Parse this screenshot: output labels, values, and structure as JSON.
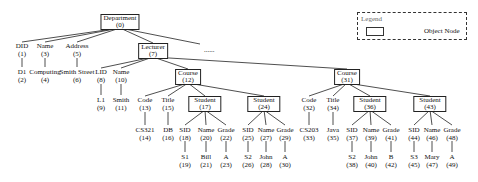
{
  "legend": {
    "title": "Legend",
    "items": [
      {
        "shape": "rectangle",
        "label": "Object Node"
      }
    ]
  },
  "ellipsis": "......",
  "nodes": {
    "n0": {
      "name": "Department",
      "id": "(0)",
      "type": "object"
    },
    "n1": {
      "name": "DID",
      "id": "(1)"
    },
    "n2": {
      "name": "D1",
      "id": "(2)"
    },
    "n3": {
      "name": "Name",
      "id": "(3)"
    },
    "n4": {
      "name": "Computing",
      "id": "(4)"
    },
    "n5": {
      "name": "Address",
      "id": "(5)"
    },
    "n6": {
      "name": "Smith Street",
      "id": "(6)"
    },
    "n7": {
      "name": "Lecturer",
      "id": "(7)",
      "type": "object"
    },
    "n8": {
      "name": "LID",
      "id": "(8)"
    },
    "n9": {
      "name": "L1",
      "id": "(9)"
    },
    "n10": {
      "name": "Name",
      "id": "(10)"
    },
    "n11": {
      "name": "Smith",
      "id": "(11)"
    },
    "n12": {
      "name": "Course",
      "id": "(12)",
      "type": "object"
    },
    "n13": {
      "name": "Code",
      "id": "(13)"
    },
    "n14": {
      "name": "CS321",
      "id": "(14)"
    },
    "n15": {
      "name": "Title",
      "id": "(15)"
    },
    "n16": {
      "name": "DB",
      "id": "(16)"
    },
    "n17": {
      "name": "Student",
      "id": "(17)",
      "type": "object"
    },
    "n18": {
      "name": "SID",
      "id": "(18)"
    },
    "n19": {
      "name": "S1",
      "id": "(19)"
    },
    "n20": {
      "name": "Name",
      "id": "(20)"
    },
    "n21": {
      "name": "Bill",
      "id": "(21)"
    },
    "n22": {
      "name": "Grade",
      "id": "(22)"
    },
    "n23": {
      "name": "A",
      "id": "(23)"
    },
    "n24": {
      "name": "Student",
      "id": "(24)",
      "type": "object"
    },
    "n25": {
      "name": "SID",
      "id": "(25)"
    },
    "n26": {
      "name": "S2",
      "id": "(26)"
    },
    "n27": {
      "name": "Name",
      "id": "(27)"
    },
    "n28": {
      "name": "John",
      "id": "(28)"
    },
    "n29": {
      "name": "Grade",
      "id": "(29)"
    },
    "n30": {
      "name": "A",
      "id": "(30)"
    },
    "n31": {
      "name": "Course",
      "id": "(31)",
      "type": "object"
    },
    "n32": {
      "name": "Code",
      "id": "(32)"
    },
    "n33": {
      "name": "CS203",
      "id": "(33)"
    },
    "n34": {
      "name": "Title",
      "id": "(34)"
    },
    "n35": {
      "name": "Java",
      "id": "(35)"
    },
    "n36": {
      "name": "Student",
      "id": "(36)",
      "type": "object"
    },
    "n37": {
      "name": "SID",
      "id": "(37)"
    },
    "n38": {
      "name": "S2",
      "id": "(38)"
    },
    "n39": {
      "name": "Name",
      "id": "(39)"
    },
    "n40": {
      "name": "John",
      "id": "(40)"
    },
    "n41": {
      "name": "Grade",
      "id": "(41)"
    },
    "n42": {
      "name": "B",
      "id": "(42)"
    },
    "n43": {
      "name": "Student",
      "id": "(43)",
      "type": "object"
    },
    "n44": {
      "name": "SID",
      "id": "(44)"
    },
    "n45": {
      "name": "S3",
      "id": "(45)"
    },
    "n46": {
      "name": "Name",
      "id": "(46)"
    },
    "n47": {
      "name": "Mary",
      "id": "(47)"
    },
    "n48": {
      "name": "Grade",
      "id": "(48)"
    },
    "n49": {
      "name": "A",
      "id": "(49)"
    }
  }
}
